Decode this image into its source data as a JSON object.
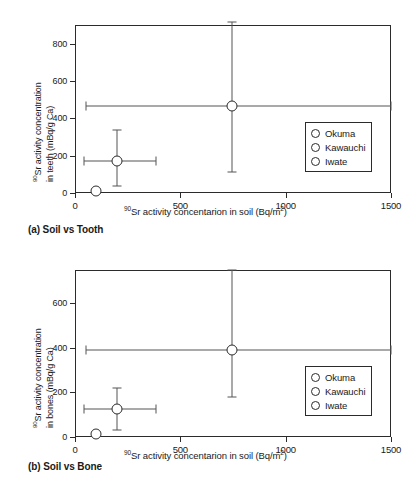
{
  "figure": {
    "panels": [
      {
        "id": "a",
        "caption": "(a) Soil vs Tooth",
        "legend": [
          "Okuma",
          "Kawauchi",
          "Iwate"
        ]
      },
      {
        "id": "b",
        "caption": "(b) Soil vs Bone",
        "legend": [
          "Okuma",
          "Kawauchi",
          "Iwate"
        ]
      }
    ]
  },
  "axis_titles": {
    "x_pre": "Sr activity concentarion in soil (Bq/m",
    "x_sup_iso": "90",
    "x_sup_unit": "2",
    "x_post": ")",
    "y_a_line1_pre": "Sr activity concentration",
    "y_a_line2": "in teeth (mBq/g Ca)",
    "y_b_line1_pre": "Sr activity concentration",
    "y_b_line2": "in bones (mBq/g Ca)",
    "y_sup_iso": "90"
  },
  "chart_data": [
    {
      "type": "scatter",
      "panel": "a",
      "title": "(a) Soil vs Tooth",
      "xlabel": "90Sr activity concentarion in soil (Bq/m2)",
      "ylabel": "90Sr activity concentration in teeth (mBq/g Ca)",
      "xlim": [
        0,
        1500
      ],
      "ylim": [
        0,
        900
      ],
      "xticks": [
        0,
        500,
        1000,
        1500
      ],
      "yticks": [
        0,
        200,
        400,
        600,
        800
      ],
      "grid": false,
      "legend_position": "lower-right-inside",
      "series": [
        {
          "name": "Okuma",
          "marker": "open-circle",
          "points": [
            {
              "x": 745,
              "y": 465,
              "xerr_low": 50,
              "xerr_high": 1500,
              "yerr_low": 110,
              "yerr_high": 915
            }
          ]
        },
        {
          "name": "Kawauchi",
          "marker": "open-circle",
          "points": [
            {
              "x": 200,
              "y": 170,
              "xerr_low": 45,
              "xerr_high": 385,
              "yerr_low": 35,
              "yerr_high": 335
            }
          ]
        },
        {
          "name": "Iwate",
          "marker": "open-circle",
          "points": [
            {
              "x": 100,
              "y": 10,
              "xerr_low": null,
              "xerr_high": null,
              "yerr_low": null,
              "yerr_high": null
            }
          ]
        }
      ]
    },
    {
      "type": "scatter",
      "panel": "b",
      "title": "(b) Soil vs Bone",
      "xlabel": "90Sr activity concentarion in soil (Bq/m2)",
      "ylabel": "90Sr activity concentration in bones (mBq/g Ca)",
      "xlim": [
        0,
        1500
      ],
      "ylim": [
        0,
        750
      ],
      "xticks": [
        0,
        500,
        1000,
        1500
      ],
      "yticks": [
        0,
        200,
        400,
        600
      ],
      "grid": false,
      "legend_position": "lower-right-inside",
      "series": [
        {
          "name": "Okuma",
          "marker": "open-circle",
          "points": [
            {
              "x": 745,
              "y": 392,
              "xerr_low": 50,
              "xerr_high": 1500,
              "yerr_low": 180,
              "yerr_high": 750
            }
          ]
        },
        {
          "name": "Kawauchi",
          "marker": "open-circle",
          "points": [
            {
              "x": 200,
              "y": 127,
              "xerr_low": 45,
              "xerr_high": 385,
              "yerr_low": 32,
              "yerr_high": 222
            }
          ]
        },
        {
          "name": "Iwate",
          "marker": "open-circle",
          "points": [
            {
              "x": 100,
              "y": 15,
              "xerr_low": null,
              "xerr_high": null,
              "yerr_low": null,
              "yerr_high": null
            }
          ]
        }
      ]
    }
  ],
  "tick_text": {
    "x": [
      "0",
      "500",
      "1000",
      "1500"
    ],
    "y_a": [
      "0",
      "200",
      "400",
      "600",
      "800"
    ],
    "y_b": [
      "0",
      "200",
      "400",
      "600"
    ]
  }
}
